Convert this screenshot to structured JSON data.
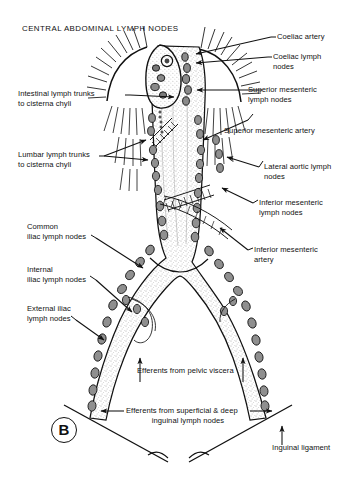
{
  "figure": {
    "title": "CENTRAL ABDOMINAL LYMPH NODES",
    "panel_label": "B",
    "background_color": "#ffffff",
    "ink_color": "#111111",
    "stipple_color": "#8a8a8a"
  },
  "labels": {
    "coeliac_artery": "Coeliac artery",
    "coeliac_lymph_nodes": "Coeliac lymph\nnodes",
    "superior_mesenteric_lymph_nodes": "Superior mesenteric\nlymph nodes",
    "superior_mesenteric_artery": "Superior mesenteric artery",
    "lateral_aortic_lymph_nodes": "Lateral aortic lymph\nnodes",
    "inferior_mesenteric_lymph_nodes": "Inferior mesenteric\nlymph nodes",
    "inferior_mesenteric_artery": "Inferior mesenteric\nartery",
    "intestinal_lymph_trunks": "Intestinal lymph trunks\nto cisterna chyli",
    "lumbar_lymph_trunks": "Lumbar lymph trunks\nto cisterna chyli",
    "common_iliac_lymph_nodes": "Common\niliac lymph nodes",
    "internal_iliac_lymph_nodes": "Internal\niliac lymph nodes",
    "external_iliac_lymph_nodes": "External iliac\nlymph nodes",
    "efferents_pelvic_viscera": "Efferents from pelvic viscera",
    "efferents_inguinal": "Efferents from superficial & deep",
    "efferents_inguinal_line2": "inguinal lymph nodes",
    "inguinal_ligament": "Inguinal ligament"
  },
  "structures": {
    "aorta": "abdominal-aorta",
    "bifurcation": "aortic-bifurcation",
    "diaphragm_left": "left-diaphragmatic-dome",
    "diaphragm_right": "right-diaphragmatic-dome",
    "cisterna_chyli": "cisterna-chyli",
    "node_chain": "lymph-node-chain"
  }
}
